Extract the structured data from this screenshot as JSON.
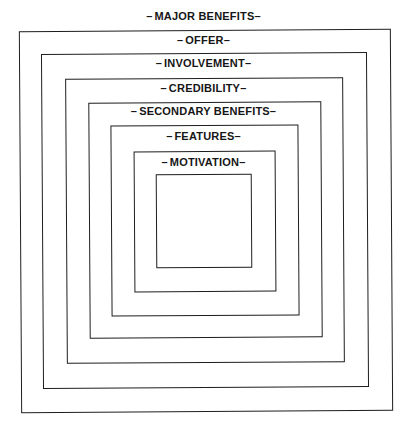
{
  "diagram": {
    "type": "nested-concentric-squares",
    "levels": [
      {
        "name": "major-benefits",
        "label": "MAJOR BENEFITS",
        "box": {
          "left": 20,
          "top": 30,
          "right": 391,
          "bottom": 411
        },
        "label_y": 10
      },
      {
        "name": "offer",
        "label": "OFFER",
        "box": {
          "left": 42,
          "top": 53,
          "right": 367,
          "bottom": 387
        },
        "label_y": 34
      },
      {
        "name": "involvement",
        "label": "INVOLVEMENT",
        "box": {
          "left": 66,
          "top": 78,
          "right": 343,
          "bottom": 362
        },
        "label_y": 57
      },
      {
        "name": "credibility",
        "label": "CREDIBILITY",
        "box": {
          "left": 89,
          "top": 102,
          "right": 321,
          "bottom": 337
        },
        "label_y": 82
      },
      {
        "name": "secondary-benefits",
        "label": "SECONDARY BENEFITS",
        "box": {
          "left": 111,
          "top": 125,
          "right": 298,
          "bottom": 315
        },
        "label_y": 105
      },
      {
        "name": "features",
        "label": "FEATURES",
        "box": {
          "left": 134,
          "top": 151,
          "right": 275,
          "bottom": 291
        },
        "label_y": 130
      },
      {
        "name": "motivation",
        "label": "MOTIVATION",
        "box": {
          "left": 156,
          "top": 174,
          "right": 251,
          "bottom": 267
        },
        "label_y": 156
      }
    ],
    "dash": "–",
    "line_color": "#1e1e1e",
    "text_color": "#161616"
  }
}
